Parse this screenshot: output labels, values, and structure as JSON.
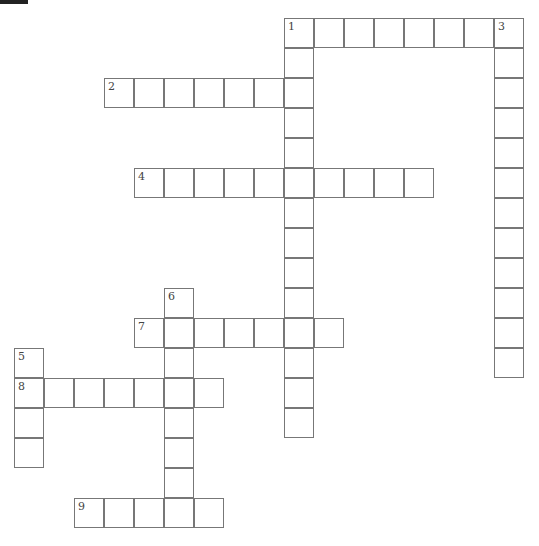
{
  "puzzle": {
    "cell_size": 30,
    "origin": {
      "x": 14,
      "y": 18
    },
    "clues": [
      {
        "number": "1",
        "direction": "across",
        "row": 0,
        "col": 9,
        "length": 8
      },
      {
        "number": "1",
        "direction": "down",
        "row": 0,
        "col": 9,
        "length": 14
      },
      {
        "number": "2",
        "direction": "across",
        "row": 2,
        "col": 3,
        "length": 7
      },
      {
        "number": "3",
        "direction": "down",
        "row": 0,
        "col": 16,
        "length": 12
      },
      {
        "number": "4",
        "direction": "across",
        "row": 5,
        "col": 4,
        "length": 10
      },
      {
        "number": "5",
        "direction": "down",
        "row": 11,
        "col": 0,
        "length": 4
      },
      {
        "number": "6",
        "direction": "down",
        "row": 9,
        "col": 5,
        "length": 8
      },
      {
        "number": "7",
        "direction": "across",
        "row": 10,
        "col": 4,
        "length": 7
      },
      {
        "number": "8",
        "direction": "across",
        "row": 12,
        "col": 0,
        "length": 7
      },
      {
        "number": "9",
        "direction": "across",
        "row": 16,
        "col": 2,
        "length": 5
      }
    ]
  }
}
